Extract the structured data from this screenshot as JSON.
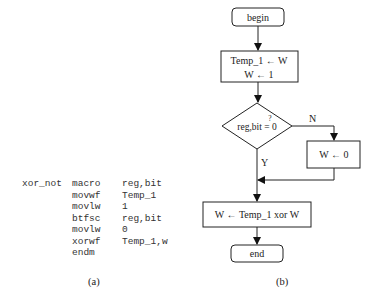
{
  "code_listing": {
    "caption": "(a)",
    "lines": [
      {
        "label": "xor_not",
        "op": "macro",
        "arg": "reg,bit"
      },
      {
        "label": "",
        "op": "movwf",
        "arg": "Temp_1"
      },
      {
        "label": "",
        "op": "movlw",
        "arg": "1"
      },
      {
        "label": "",
        "op": "btfsc",
        "arg": "reg,bit"
      },
      {
        "label": "",
        "op": "movlw",
        "arg": "0"
      },
      {
        "label": "",
        "op": "xorwf",
        "arg": "Temp_1,w"
      },
      {
        "label": "",
        "op": "endm",
        "arg": ""
      }
    ]
  },
  "flowchart": {
    "caption": "(b)",
    "begin": "begin",
    "init_line1": "Temp_1 ← W",
    "init_line2": "W ← 1",
    "decision": "reg,bit = 0",
    "decision_q": "?",
    "no_label": "N",
    "yes_label": "Y",
    "no_branch": "W ← 0",
    "xor_step": "W ← Temp_1 xor W",
    "end": "end"
  }
}
